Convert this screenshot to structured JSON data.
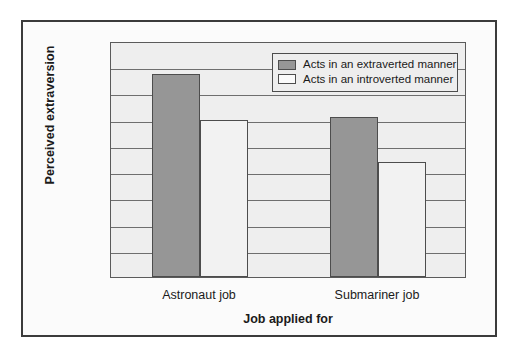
{
  "chart_data": {
    "type": "bar",
    "title": "",
    "xlabel": "Job applied for",
    "ylabel": "Perceived extraversion",
    "categories": [
      "Astronaut job",
      "Submariner job"
    ],
    "series": [
      {
        "name": "Acts in an extraverted manner",
        "values": [
          15.5,
          12.2
        ],
        "color": "#969696"
      },
      {
        "name": "Acts in an introverted manner",
        "values": [
          12.0,
          8.8
        ],
        "color": "#f2f2f2"
      }
    ],
    "ylim": [
      0,
      18
    ],
    "yticks": [
      0,
      2,
      4,
      6,
      8,
      10,
      12,
      14,
      16,
      18
    ],
    "ytick_labels": [
      "0",
      "2",
      "4",
      "6",
      "8",
      "10",
      "12",
      "14",
      "16",
      "18"
    ],
    "grid": "horizontal",
    "legend_position": "top-right"
  },
  "legend": {
    "entries": [
      {
        "label": "Acts in an extraverted manner",
        "swatch": "filled"
      },
      {
        "label": "Acts in an introverted manner",
        "swatch": "hollow"
      }
    ]
  },
  "colors": {
    "bar_filled": "#969696",
    "bar_hollow": "#f2f2f2",
    "bar_border": "#4d4d4d",
    "plot_background": "#eeeeee",
    "gridline": "#6e6e6e",
    "frame_border": "#3b3b3b",
    "page_background": "#ffffff",
    "text": "#1a1a1a"
  }
}
